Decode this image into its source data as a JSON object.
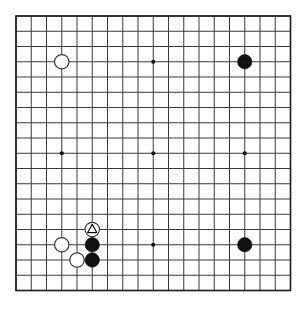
{
  "board": {
    "kind": "go-board",
    "size": 19,
    "origin_x": 16,
    "origin_y": 16,
    "spacing": 15.25,
    "line_color": "#3a3a3a",
    "edge_color": "#1a1a1a",
    "background_color": "#ffffff",
    "line_width": 1,
    "edge_width": 1.6,
    "stone_radius": 7.2,
    "star_radius": 2.1,
    "star_color": "#111111",
    "black_color": "#111111",
    "white_color": "#ffffff",
    "white_outline_color": "#3a3a3a",
    "mark_color": "#111111",
    "star_points": [
      {
        "col": 4,
        "row": 4
      },
      {
        "col": 10,
        "row": 4
      },
      {
        "col": 16,
        "row": 4
      },
      {
        "col": 4,
        "row": 10
      },
      {
        "col": 10,
        "row": 10
      },
      {
        "col": 16,
        "row": 10
      },
      {
        "col": 4,
        "row": 16
      },
      {
        "col": 10,
        "row": 16
      },
      {
        "col": 16,
        "row": 16
      }
    ],
    "stones": [
      {
        "id": "stone-d16",
        "color": "white",
        "col": 4,
        "row": 4,
        "label": "D16",
        "mark": "none"
      },
      {
        "id": "stone-q16",
        "color": "black",
        "col": 16,
        "row": 4,
        "label": "Q16",
        "mark": "none"
      },
      {
        "id": "stone-q4",
        "color": "black",
        "col": 16,
        "row": 16,
        "label": "Q4",
        "mark": "none"
      },
      {
        "id": "stone-f5",
        "color": "white",
        "col": 6,
        "row": 15,
        "label": "F5",
        "mark": "triangle"
      },
      {
        "id": "stone-d4",
        "color": "white",
        "col": 4,
        "row": 16,
        "label": "D4",
        "mark": "none"
      },
      {
        "id": "stone-f4",
        "color": "black",
        "col": 6,
        "row": 16,
        "label": "F4",
        "mark": "none"
      },
      {
        "id": "stone-e3",
        "color": "white",
        "col": 5,
        "row": 17,
        "label": "E3",
        "mark": "none"
      },
      {
        "id": "stone-f3",
        "color": "black",
        "col": 6,
        "row": 17,
        "label": "F3",
        "mark": "none"
      }
    ]
  }
}
